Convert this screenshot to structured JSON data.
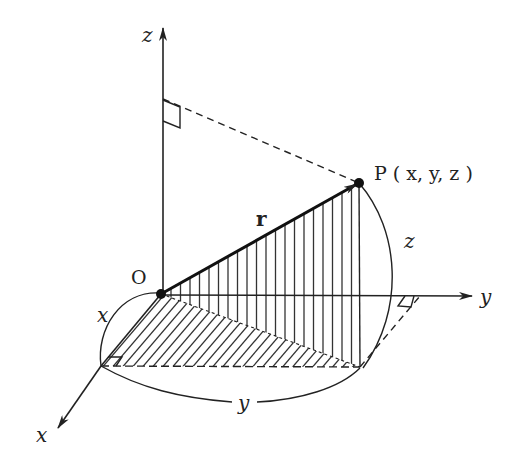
{
  "diagram": {
    "colors": {
      "ink": "#222222",
      "background": "#ffffff"
    },
    "axes": {
      "z": {
        "label": "z"
      },
      "y": {
        "label": "y"
      },
      "x": {
        "label": "x"
      }
    },
    "points": {
      "origin": {
        "label": "O"
      },
      "P": {
        "label": "P ( x, y, z )"
      }
    },
    "vector": {
      "label": "r"
    },
    "dimensions": {
      "x_arc": {
        "label": "x"
      },
      "y_arc": {
        "label": "y"
      },
      "z_arc": {
        "label": "z"
      }
    }
  }
}
